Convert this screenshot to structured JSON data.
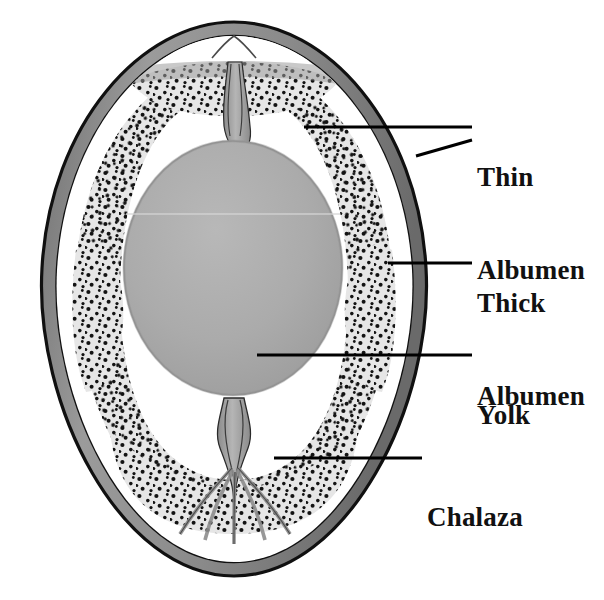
{
  "diagram": {
    "type": "anatomical-illustration",
    "background_color": "#ffffff",
    "labels": [
      {
        "id": "thin_albumen",
        "line1": "Thin",
        "line2": "Albumen",
        "text": "Thin Albumen"
      },
      {
        "id": "thick_albumen",
        "line1": "Thick",
        "line2": "Albumen",
        "text": "Thick Albumen"
      },
      {
        "id": "yolk",
        "line1": "Yolk",
        "line2": "",
        "text": "Yolk"
      },
      {
        "id": "chalaza",
        "line1": "Chalaza",
        "line2": "",
        "text": "Chalaza"
      }
    ],
    "parts": [
      {
        "id": "shell",
        "name": "Shell",
        "color": "#8c8c8c"
      },
      {
        "id": "shell_outline",
        "name": "Shell outline",
        "color": "#141414"
      },
      {
        "id": "thin_albumen",
        "name": "Thin albumen",
        "color": "#ffffff"
      },
      {
        "id": "thick_albumen",
        "name": "Thick albumen",
        "color": "#e3e3e3"
      },
      {
        "id": "stipple_dots",
        "name": "Stipple dots",
        "color": "#111111"
      },
      {
        "id": "yolk",
        "name": "Yolk",
        "color": "#a9a9a9"
      },
      {
        "id": "chalaza",
        "name": "Chalaza",
        "color": "#9a9a9a"
      },
      {
        "id": "leader_line",
        "name": "Leader line",
        "color": "#000000"
      }
    ]
  }
}
